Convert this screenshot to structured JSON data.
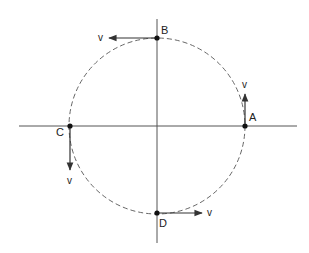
{
  "diagram": {
    "type": "circular-motion-velocity-vectors",
    "center": {
      "x": 157,
      "y": 126
    },
    "radius": 88,
    "axes": {
      "horizontal": {
        "x1": 19,
        "x2": 297,
        "y": 126
      },
      "vertical": {
        "x": 157,
        "y1": 19,
        "y2": 243
      }
    },
    "points": [
      {
        "id": "A",
        "label": "A",
        "position": "right",
        "velocity_label": "v",
        "velocity_direction": "up"
      },
      {
        "id": "B",
        "label": "B",
        "position": "top",
        "velocity_label": "v",
        "velocity_direction": "left"
      },
      {
        "id": "C",
        "label": "C",
        "position": "left",
        "velocity_label": "v",
        "velocity_direction": "down"
      },
      {
        "id": "D",
        "label": "D",
        "position": "bottom",
        "velocity_label": "v",
        "velocity_direction": "right"
      }
    ],
    "colors": {
      "axis": "#555555",
      "orbit": "#666666",
      "vector": "#333333",
      "point": "#111111",
      "text": "#222222"
    }
  }
}
